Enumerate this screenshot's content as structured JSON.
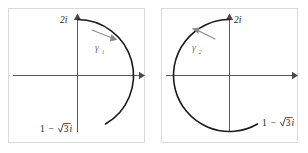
{
  "figure": {
    "type": "diagram",
    "width": 308,
    "height": 153,
    "background": "#ffffff",
    "frame_color": "#d9d9d9",
    "axis_color": "#5a5a5a",
    "contour_color": "#1a1a1a",
    "annotation_color": "#8a8a8a"
  },
  "panels": [
    {
      "id": "left-panel",
      "contour_label": "γ",
      "contour_index": "1",
      "endpoint_top_label": "2i",
      "endpoint_top_label_side": "left",
      "endpoint_bottom_label_real": "1",
      "endpoint_bottom_label_minus": "−",
      "endpoint_bottom_label_radicand": "3",
      "endpoint_bottom_label_imag": "i",
      "endpoint_bottom_label_full": "1 − √3i",
      "direction": "clockwise",
      "arc_start_angle_deg": 90,
      "arc_end_angle_deg": -60,
      "arc_sweep_deg": -150,
      "radius": 2,
      "passes_through": "2",
      "axes": {
        "real": "horizontal",
        "imaginary": "vertical"
      }
    },
    {
      "id": "right-panel",
      "contour_label": "γ",
      "contour_index": "2",
      "endpoint_top_label": "2i",
      "endpoint_top_label_side": "right",
      "endpoint_bottom_label_real": "1",
      "endpoint_bottom_label_minus": "−",
      "endpoint_bottom_label_radicand": "3",
      "endpoint_bottom_label_imag": "i",
      "endpoint_bottom_label_full": "1 − √3i",
      "direction": "counterclockwise",
      "arc_start_angle_deg": 90,
      "arc_end_angle_deg": -60,
      "arc_sweep_deg": 210,
      "radius": 2,
      "passes_through": "-2, -2i",
      "axes": {
        "real": "horizontal",
        "imaginary": "vertical"
      }
    }
  ]
}
